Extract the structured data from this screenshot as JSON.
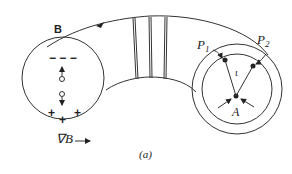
{
  "figure": {
    "caption": "(a)",
    "field_label": "B",
    "gradient_label": "∇B",
    "gradient_arrow": "→",
    "left_cross_section": {
      "top_charges": "− − −",
      "bottom_charges": [
        "+",
        "+",
        "+"
      ]
    },
    "right_cross_section": {
      "point1_label": "P",
      "point1_sub": "1",
      "point2_label": "P",
      "point2_sub": "2",
      "angle_label": "ι",
      "axis_label": "A"
    },
    "colors": {
      "line": "#333333",
      "background": "#ffffff"
    }
  }
}
